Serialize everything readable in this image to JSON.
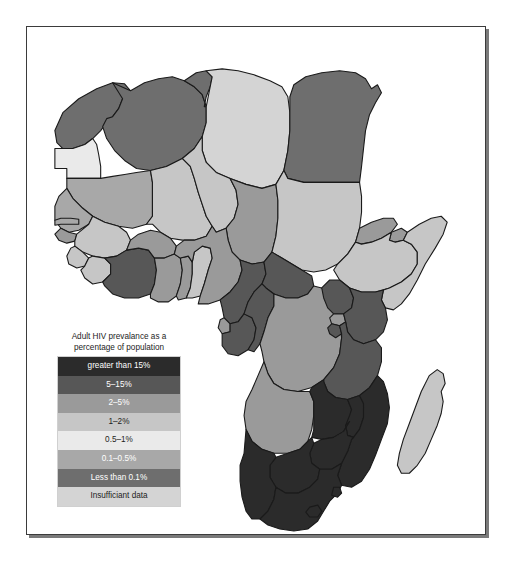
{
  "document": {
    "type": "thematic-choropleth-map",
    "region": "Africa",
    "background_color": "#ffffff",
    "frame_border_color": "#3b3b3b",
    "shadow_color": "#7a7a7a"
  },
  "legend": {
    "title_line_1": "Adult HIV prevalance as a",
    "title_line_2": "percentage of population",
    "title_full": "Adult HIV prevalance as a percentage of population",
    "entries": [
      {
        "label": "greater than 15%",
        "color": "#2b2b2b",
        "text_color": "#ffffff"
      },
      {
        "label": "5–15%",
        "color": "#575757",
        "text_color": "#ffffff"
      },
      {
        "label": "2–5%",
        "color": "#9a9a9a",
        "text_color": "#ffffff"
      },
      {
        "label": "1–2%",
        "color": "#c6c6c6",
        "text_color": "#1d1d1d"
      },
      {
        "label": "0.5–1%",
        "color": "#eaeaea",
        "text_color": "#1d1d1d"
      },
      {
        "label": "0.1–0.5%",
        "color": "#a8a8a8",
        "text_color": "#ffffff"
      },
      {
        "label": "Less than 0.1%",
        "color": "#6e6e6e",
        "text_color": "#ffffff"
      },
      {
        "label": "Insufficiant data",
        "color": "#d4d4d4",
        "text_color": "#1d1d1d"
      }
    ]
  },
  "map_data": {
    "type": "choropleth",
    "palette": {
      "gt15": "#2b2b2b",
      "p5_15": "#575757",
      "p2_5": "#9a9a9a",
      "p1_2": "#c6c6c6",
      "p05_1": "#eaeaea",
      "p01_05": "#a8a8a8",
      "lt01": "#6e6e6e",
      "nodata": "#d4d4d4",
      "border": "#1a1a1a",
      "ocean": "#ffffff"
    },
    "countries": [
      {
        "name": "Morocco",
        "class": "lt01"
      },
      {
        "name": "Western Sahara",
        "class": "p05_1"
      },
      {
        "name": "Algeria",
        "class": "lt01"
      },
      {
        "name": "Tunisia",
        "class": "lt01"
      },
      {
        "name": "Libya",
        "class": "nodata"
      },
      {
        "name": "Egypt",
        "class": "lt01"
      },
      {
        "name": "Mauritania",
        "class": "p01_05"
      },
      {
        "name": "Mali",
        "class": "p1_2"
      },
      {
        "name": "Niger",
        "class": "p1_2"
      },
      {
        "name": "Chad",
        "class": "p2_5"
      },
      {
        "name": "Sudan",
        "class": "p1_2"
      },
      {
        "name": "Eritrea",
        "class": "p2_5"
      },
      {
        "name": "Djibouti",
        "class": "p2_5"
      },
      {
        "name": "Ethiopia",
        "class": "p1_2"
      },
      {
        "name": "Somalia",
        "class": "p1_2"
      },
      {
        "name": "Senegal",
        "class": "p01_05"
      },
      {
        "name": "Gambia",
        "class": "p01_05"
      },
      {
        "name": "Guinea-Bissau",
        "class": "p2_5"
      },
      {
        "name": "Guinea",
        "class": "p1_2"
      },
      {
        "name": "Sierra Leone",
        "class": "p1_2"
      },
      {
        "name": "Liberia",
        "class": "p1_2"
      },
      {
        "name": "Ivory Coast",
        "class": "p5_15"
      },
      {
        "name": "Burkina Faso",
        "class": "p2_5"
      },
      {
        "name": "Ghana",
        "class": "p2_5"
      },
      {
        "name": "Togo",
        "class": "p2_5"
      },
      {
        "name": "Benin",
        "class": "p1_2"
      },
      {
        "name": "Nigeria",
        "class": "p2_5"
      },
      {
        "name": "Cameroon",
        "class": "p5_15"
      },
      {
        "name": "Central African Republic",
        "class": "p5_15"
      },
      {
        "name": "Equatorial Guinea",
        "class": "p2_5"
      },
      {
        "name": "Gabon",
        "class": "p5_15"
      },
      {
        "name": "Republic of the Congo",
        "class": "p5_15"
      },
      {
        "name": "Democratic Republic of the Congo",
        "class": "p2_5"
      },
      {
        "name": "Uganda",
        "class": "p5_15"
      },
      {
        "name": "Rwanda",
        "class": "p2_5"
      },
      {
        "name": "Burundi",
        "class": "p5_15"
      },
      {
        "name": "Kenya",
        "class": "p5_15"
      },
      {
        "name": "Tanzania",
        "class": "p5_15"
      },
      {
        "name": "Angola",
        "class": "p2_5"
      },
      {
        "name": "Zambia",
        "class": "gt15"
      },
      {
        "name": "Malawi",
        "class": "gt15"
      },
      {
        "name": "Mozambique",
        "class": "gt15"
      },
      {
        "name": "Zimbabwe",
        "class": "gt15"
      },
      {
        "name": "Botswana",
        "class": "gt15"
      },
      {
        "name": "Namibia",
        "class": "gt15"
      },
      {
        "name": "South Africa",
        "class": "gt15"
      },
      {
        "name": "Lesotho",
        "class": "gt15"
      },
      {
        "name": "Swaziland",
        "class": "gt15"
      },
      {
        "name": "Madagascar",
        "class": "p1_2"
      }
    ]
  }
}
